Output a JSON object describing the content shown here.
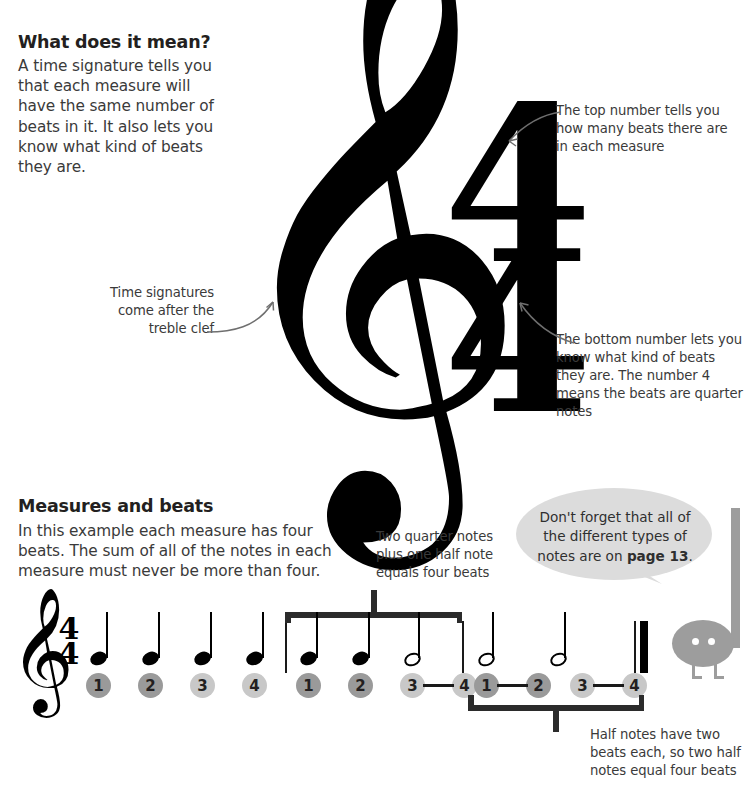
{
  "sections": {
    "top": {
      "heading": "What does it mean?",
      "body": "A time signature tells you that each measure will have the same number of beats in it. It also lets you know what kind of beats they are.",
      "time_signature": {
        "top": "4",
        "bottom": "4"
      },
      "callouts": {
        "treble_clef": "Time signatures come after the treble clef",
        "top_number": "The top number tells you how many beats there are in each measure",
        "bottom_number": "The bottom number lets you know what kind of beats they are. The number 4 means the beats are quarter notes"
      }
    },
    "bottom": {
      "heading": "Measures and beats",
      "body": "In this example each measure has four beats. The sum of all of the notes in each measure must never be more than four.",
      "callouts": {
        "measure_two": "Two quarter notes plus one half note equals four beats",
        "measure_three": "Half notes have two beats each, so two half notes equal four beats"
      },
      "speech_bubble": {
        "line1": "Don't forget that all of",
        "line2": "the different types of",
        "line3_prefix": "notes are on ",
        "line3_bold": "page 13",
        "line3_suffix": "."
      },
      "staff": {
        "clef": "treble-clef",
        "time_signature": {
          "top": "4",
          "bottom": "4"
        },
        "measures": [
          {
            "notes": [
              "quarter",
              "quarter",
              "quarter",
              "quarter"
            ],
            "beats": [
              "1",
              "2",
              "3",
              "4"
            ]
          },
          {
            "notes": [
              "quarter",
              "quarter",
              "half"
            ],
            "beats": [
              "1",
              "2",
              "3",
              "4"
            ]
          },
          {
            "notes": [
              "half",
              "half"
            ],
            "beats": [
              "1",
              "2",
              "3",
              "4"
            ]
          }
        ]
      }
    }
  },
  "colors": {
    "ink": "#231f20",
    "body_text": "#3a3a3a",
    "beat_dark": "#9a9a9a",
    "beat_light": "#c8c8c8",
    "bubble_gray": "#dcdcdc",
    "bird_gray": "#9d9d9d"
  }
}
